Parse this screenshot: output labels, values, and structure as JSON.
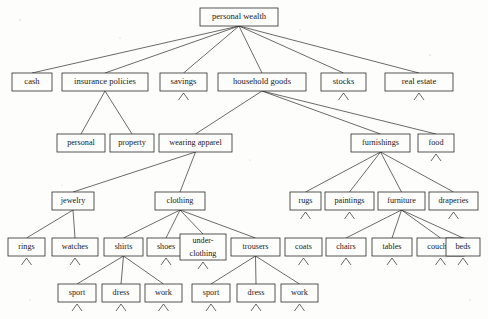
{
  "diagram": {
    "type": "hierarchical-tree",
    "background_color": "#fdfdfc",
    "line_color": "#2b2b2b",
    "text_color": "#1a1a1a",
    "levels": 6
  },
  "nodes": [
    {
      "id": "personal-wealth",
      "label": "personal wealth",
      "x": 200,
      "y": 8,
      "w": 78,
      "h": 18,
      "font": 8.6,
      "level": 0,
      "stub": false
    },
    {
      "id": "cash",
      "label": "cash",
      "x": 12,
      "y": 73,
      "w": 40,
      "h": 18,
      "font": 8.6,
      "level": 1,
      "stub": false
    },
    {
      "id": "insurance-policies",
      "label": "insurance policies",
      "x": 62,
      "y": 73,
      "w": 86,
      "h": 18,
      "font": 8.6,
      "level": 1,
      "stub": false
    },
    {
      "id": "savings",
      "label": "savings",
      "x": 160,
      "y": 73,
      "w": 47,
      "h": 18,
      "font": 8.6,
      "level": 1,
      "stub": true
    },
    {
      "id": "household-goods",
      "label": "household goods",
      "x": 218,
      "y": 73,
      "w": 88,
      "h": 18,
      "font": 8.6,
      "level": 1,
      "stub": false
    },
    {
      "id": "stocks",
      "label": "stocks",
      "x": 321,
      "y": 73,
      "w": 45,
      "h": 18,
      "font": 8.6,
      "level": 1,
      "stub": true
    },
    {
      "id": "real-estate",
      "label": "real estate",
      "x": 385,
      "y": 73,
      "w": 68,
      "h": 18,
      "font": 8.6,
      "level": 1,
      "stub": true
    },
    {
      "id": "personal",
      "label": "personal",
      "x": 57,
      "y": 134,
      "w": 48,
      "h": 18,
      "font": 8.2,
      "level": 2,
      "stub": false
    },
    {
      "id": "property",
      "label": "property",
      "x": 110,
      "y": 134,
      "w": 44,
      "h": 18,
      "font": 8.2,
      "level": 2,
      "stub": false
    },
    {
      "id": "wearing-apparel",
      "label": "wearing apparel",
      "x": 159,
      "y": 134,
      "w": 73,
      "h": 18,
      "font": 8.2,
      "level": 2,
      "stub": false
    },
    {
      "id": "furnishings",
      "label": "furnishings",
      "x": 351,
      "y": 134,
      "w": 59,
      "h": 18,
      "font": 8.2,
      "level": 2,
      "stub": false
    },
    {
      "id": "food",
      "label": "food",
      "x": 418,
      "y": 134,
      "w": 36,
      "h": 18,
      "font": 8.2,
      "level": 2,
      "stub": true
    },
    {
      "id": "jewelry",
      "label": "jewelry",
      "x": 52,
      "y": 192,
      "w": 42,
      "h": 18,
      "font": 8.2,
      "level": 3,
      "stub": false
    },
    {
      "id": "clothing",
      "label": "clothing",
      "x": 155,
      "y": 192,
      "w": 50,
      "h": 18,
      "font": 8.2,
      "level": 3,
      "stub": false
    },
    {
      "id": "rugs",
      "label": "rugs",
      "x": 290,
      "y": 192,
      "w": 31,
      "h": 18,
      "font": 8.2,
      "level": 3,
      "stub": true
    },
    {
      "id": "paintings",
      "label": "paintings",
      "x": 325,
      "y": 192,
      "w": 49,
      "h": 18,
      "font": 8.2,
      "level": 3,
      "stub": true
    },
    {
      "id": "furniture",
      "label": "furniture",
      "x": 378,
      "y": 192,
      "w": 47,
      "h": 18,
      "font": 8.2,
      "level": 3,
      "stub": false
    },
    {
      "id": "draperies",
      "label": "draperies",
      "x": 429,
      "y": 192,
      "w": 49,
      "h": 18,
      "font": 8.2,
      "level": 3,
      "stub": true
    },
    {
      "id": "rings",
      "label": "rings",
      "x": 8,
      "y": 238,
      "w": 37,
      "h": 18,
      "font": 8.2,
      "level": 4,
      "stub": true
    },
    {
      "id": "watches",
      "label": "watches",
      "x": 52,
      "y": 238,
      "w": 46,
      "h": 18,
      "font": 8.2,
      "level": 4,
      "stub": true
    },
    {
      "id": "shirts",
      "label": "shirts",
      "x": 104,
      "y": 238,
      "w": 39,
      "h": 18,
      "font": 8.2,
      "level": 4,
      "stub": false
    },
    {
      "id": "shoes",
      "label": "shoes",
      "x": 147,
      "y": 238,
      "w": 38,
      "h": 18,
      "font": 8.2,
      "level": 4,
      "stub": true
    },
    {
      "id": "under-clothing",
      "label": "under-\nclothing",
      "x": 180,
      "y": 234,
      "w": 46,
      "h": 26,
      "font": 8.2,
      "level": 4,
      "stub": true
    },
    {
      "id": "trousers",
      "label": "trousers",
      "x": 231,
      "y": 238,
      "w": 49,
      "h": 18,
      "font": 8.2,
      "level": 4,
      "stub": false
    },
    {
      "id": "coats",
      "label": "coats",
      "x": 285,
      "y": 238,
      "w": 37,
      "h": 18,
      "font": 8.2,
      "level": 4,
      "stub": true
    },
    {
      "id": "chairs",
      "label": "chairs",
      "x": 326,
      "y": 238,
      "w": 40,
      "h": 18,
      "font": 8.2,
      "level": 4,
      "stub": true
    },
    {
      "id": "tables",
      "label": "tables",
      "x": 372,
      "y": 238,
      "w": 40,
      "h": 18,
      "font": 8.2,
      "level": 4,
      "stub": true
    },
    {
      "id": "couches",
      "label": "couches",
      "x": 417,
      "y": 238,
      "w": 47,
      "h": 18,
      "font": 8.2,
      "level": 4,
      "stub": true
    },
    {
      "id": "beds",
      "label": "beds",
      "x": 446,
      "y": 238,
      "w": 34,
      "h": 18,
      "font": 8.2,
      "level": 4,
      "stub": true
    },
    {
      "id": "shirts-sport",
      "label": "sport",
      "x": 58,
      "y": 284,
      "w": 38,
      "h": 18,
      "font": 8.2,
      "level": 5,
      "stub": true
    },
    {
      "id": "shirts-dress",
      "label": "dress",
      "x": 102,
      "y": 284,
      "w": 38,
      "h": 18,
      "font": 8.2,
      "level": 5,
      "stub": true
    },
    {
      "id": "shirts-work",
      "label": "work",
      "x": 145,
      "y": 284,
      "w": 37,
      "h": 18,
      "font": 8.2,
      "level": 5,
      "stub": true
    },
    {
      "id": "trousers-sport",
      "label": "sport",
      "x": 192,
      "y": 284,
      "w": 38,
      "h": 18,
      "font": 8.2,
      "level": 5,
      "stub": true
    },
    {
      "id": "trousers-dress",
      "label": "dress",
      "x": 237,
      "y": 284,
      "w": 38,
      "h": 18,
      "font": 8.2,
      "level": 5,
      "stub": true
    },
    {
      "id": "trousers-work",
      "label": "work",
      "x": 281,
      "y": 284,
      "w": 37,
      "h": 18,
      "font": 8.2,
      "level": 5,
      "stub": true
    }
  ],
  "edges": [
    {
      "from": "personal-wealth",
      "to": "cash"
    },
    {
      "from": "personal-wealth",
      "to": "insurance-policies"
    },
    {
      "from": "personal-wealth",
      "to": "savings"
    },
    {
      "from": "personal-wealth",
      "to": "household-goods"
    },
    {
      "from": "personal-wealth",
      "to": "stocks"
    },
    {
      "from": "personal-wealth",
      "to": "real-estate"
    },
    {
      "from": "insurance-policies",
      "to": "personal"
    },
    {
      "from": "insurance-policies",
      "to": "property"
    },
    {
      "from": "household-goods",
      "to": "wearing-apparel"
    },
    {
      "from": "household-goods",
      "to": "furnishings"
    },
    {
      "from": "household-goods",
      "to": "food"
    },
    {
      "from": "wearing-apparel",
      "to": "jewelry"
    },
    {
      "from": "wearing-apparel",
      "to": "clothing"
    },
    {
      "from": "furnishings",
      "to": "rugs"
    },
    {
      "from": "furnishings",
      "to": "paintings"
    },
    {
      "from": "furnishings",
      "to": "furniture"
    },
    {
      "from": "furnishings",
      "to": "draperies"
    },
    {
      "from": "jewelry",
      "to": "rings"
    },
    {
      "from": "jewelry",
      "to": "watches"
    },
    {
      "from": "clothing",
      "to": "shirts"
    },
    {
      "from": "clothing",
      "to": "shoes"
    },
    {
      "from": "clothing",
      "to": "under-clothing"
    },
    {
      "from": "clothing",
      "to": "trousers"
    },
    {
      "from": "furniture",
      "to": "chairs"
    },
    {
      "from": "furniture",
      "to": "tables"
    },
    {
      "from": "furniture",
      "to": "couches"
    },
    {
      "from": "furniture",
      "to": "beds"
    },
    {
      "from": "shirts",
      "to": "shirts-sport"
    },
    {
      "from": "shirts",
      "to": "shirts-dress"
    },
    {
      "from": "shirts",
      "to": "shirts-work"
    },
    {
      "from": "trousers",
      "to": "trousers-sport"
    },
    {
      "from": "trousers",
      "to": "trousers-dress"
    },
    {
      "from": "trousers",
      "to": "trousers-work"
    }
  ],
  "specks": [
    {
      "x": 20,
      "y": 20,
      "r": 0.7
    },
    {
      "x": 120,
      "y": 38,
      "r": 0.6
    },
    {
      "x": 300,
      "y": 30,
      "r": 0.6
    },
    {
      "x": 430,
      "y": 55,
      "r": 0.7
    },
    {
      "x": 62,
      "y": 185,
      "r": 0.6
    },
    {
      "x": 250,
      "y": 160,
      "r": 0.6
    },
    {
      "x": 470,
      "y": 300,
      "r": 0.7
    },
    {
      "x": 30,
      "y": 300,
      "r": 0.6
    }
  ]
}
